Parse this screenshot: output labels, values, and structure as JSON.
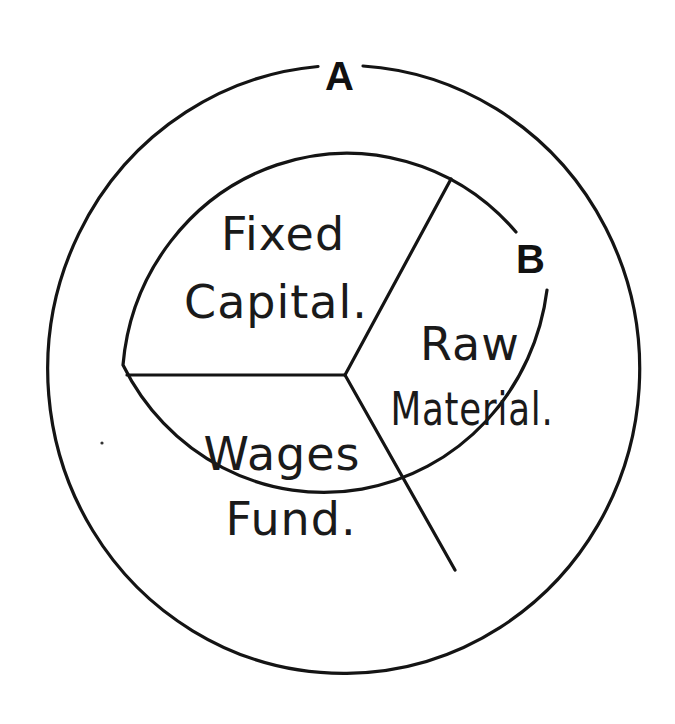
{
  "diagram": {
    "type": "concentric-circle-pie",
    "outer_circle": {
      "label": "A"
    },
    "inner_circle": {
      "label": "B",
      "segments": [
        {
          "id": "fixed-capital",
          "lines": [
            "Fixed",
            "Capital."
          ]
        },
        {
          "id": "raw-material",
          "lines": [
            "Raw",
            "Material."
          ]
        },
        {
          "id": "wages-fund",
          "lines": [
            "Wages",
            "Fund."
          ]
        }
      ]
    },
    "colors": {
      "ink": "#141414",
      "background": "#ffffff"
    }
  }
}
